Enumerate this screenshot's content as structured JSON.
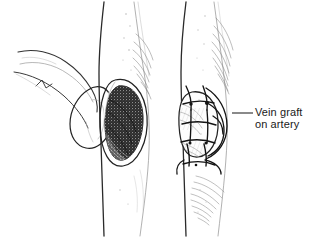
{
  "illustration": {
    "kind": "surgical-line-drawing",
    "title_visible": false,
    "background_color": "#ffffff",
    "ink_color": "#1a1a1a",
    "light_ink_color": "#8c8c8c",
    "shading_color": "#6e6e6e",
    "width": 310,
    "height": 238
  },
  "annotations": {
    "vein_graft": {
      "line1": "Vein graft",
      "line2": "on artery",
      "text_x": 255,
      "text_y": 106,
      "leader_from_x": 232,
      "leader_from_y": 113,
      "leader_to_x": 253,
      "leader_to_y": 113
    }
  },
  "figures": {
    "left_structure": {
      "name": "dissected tissue flap",
      "description": "curved pencil-outlined flap or retracted tissue tongue at far left"
    },
    "center_vessel": {
      "name": "artery with arteriotomy",
      "description": "vertical vessel trunk with dark stippled oval opening exposing lumen"
    },
    "right_vessel": {
      "name": "artery with vein patch graft",
      "description": "same vessel with oval vein patch sutured over the opening, stitches radiating around the patch margin"
    }
  }
}
